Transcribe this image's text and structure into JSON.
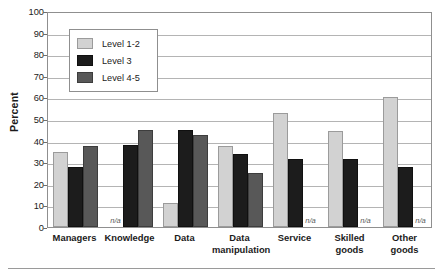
{
  "chart_data": {
    "type": "bar",
    "title": "",
    "xlabel": "",
    "ylabel": "Percent",
    "ylim": [
      0,
      100
    ],
    "ytick_step": 10,
    "yticks": [
      100,
      90,
      80,
      70,
      60,
      50,
      40,
      30,
      20,
      10,
      0
    ],
    "grid": true,
    "legend_position": "upper-left-inside",
    "na_label": "n/a",
    "categories": [
      "Managers",
      "Knowledge",
      "Data",
      "Data manipulation",
      "Service",
      "Skilled goods",
      "Other goods"
    ],
    "category_lines": [
      [
        "Managers"
      ],
      [
        "Knowledge"
      ],
      [
        "Data"
      ],
      [
        "Data",
        "manipulation"
      ],
      [
        "Service"
      ],
      [
        "Skilled",
        "goods"
      ],
      [
        "Other",
        "goods"
      ]
    ],
    "series": [
      {
        "name": "Level 1-2",
        "color": "#d2d2d2",
        "values": [
          34.5,
          null,
          11,
          37.5,
          53,
          44.5,
          60
        ]
      },
      {
        "name": "Level 3",
        "color": "#1c1c1c",
        "values": [
          28,
          38,
          45,
          34,
          31.5,
          31.5,
          28
        ]
      },
      {
        "name": "Level 4-5",
        "color": "#585858",
        "values": [
          37.5,
          45,
          42.5,
          25,
          null,
          null,
          null
        ]
      }
    ]
  },
  "legend": {
    "items": [
      {
        "label": "Level 1-2"
      },
      {
        "label": "Level 3"
      },
      {
        "label": "Level 4-5"
      }
    ]
  },
  "axis": {
    "y_title": "Percent"
  }
}
